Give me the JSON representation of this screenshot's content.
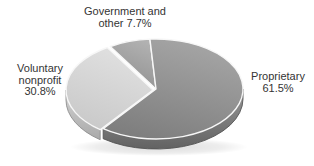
{
  "page": {
    "background_color": "#ffffff",
    "text_color": "#343434"
  },
  "labels": {
    "government": {
      "line1": "Government and",
      "line2": "other 7.7%"
    },
    "voluntary": {
      "line1": "Voluntary",
      "line2": "nonprofit",
      "line3": "30.8%"
    },
    "proprietary": {
      "line1": "Proprietary",
      "line2": "61.5%"
    }
  },
  "chart_data": {
    "type": "pie",
    "style": "3d",
    "title": "",
    "categories": [
      "Government and other",
      "Voluntary nonprofit",
      "Proprietary"
    ],
    "values": [
      7.7,
      30.8,
      61.5
    ],
    "unit": "%",
    "start_angle_deg": 94,
    "direction": "counterclockwise",
    "legend": "none",
    "geometry": {
      "cx": 156,
      "cy": 89,
      "rx": 87,
      "ry": 50,
      "depth": 10
    },
    "gap_stroke": "#f7f7f7",
    "shadow": true,
    "slices": [
      {
        "label": "Government and other",
        "value": 7.7,
        "top_colors": [
          "#b2b2b2",
          "#8f8f8f"
        ],
        "side_colors": [
          "#a0a0a0",
          "#7d7d7d"
        ],
        "side_stroke": "#6f6f6f",
        "explode": [
          0,
          0
        ]
      },
      {
        "label": "Voluntary nonprofit",
        "value": 30.8,
        "top_colors": [
          "#e1e1e1",
          "#c9c9c9"
        ],
        "side_colors": [
          "#d3d3d3",
          "#a9a9a9"
        ],
        "side_stroke": "#8f8f8f",
        "explode": [
          -3,
          1
        ]
      },
      {
        "label": "Proprietary",
        "value": 61.5,
        "top_colors": [
          "#a6a6a6",
          "#7e7e7e"
        ],
        "side_colors": [
          "#989898",
          "#626262"
        ],
        "side_stroke": "#555555",
        "explode": [
          0,
          0
        ]
      }
    ]
  }
}
